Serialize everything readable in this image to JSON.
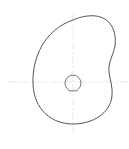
{
  "drawing": {
    "type": "cam-profile-sketch",
    "colors": {
      "background": "#ffffff",
      "profile": "#555555",
      "bore": "#666666",
      "centerline": "#d9d9d9"
    },
    "centerlines": {
      "horizontal": {
        "x1": 8,
        "y1": 82,
        "x2": 129,
        "y2": 82
      },
      "vertical": {
        "x1": 73,
        "y1": 14,
        "x2": 73,
        "y2": 136
      }
    },
    "profile_path": "M 73 124 C 52 124, 34 110, 33 84 C 32 58, 44 30, 73 20 C 80 17, 88 15, 96 16 C 110 18, 117 30, 115 46 C 113 56, 108 62, 109 72 C 110 80, 113 88, 112 96 C 110 114, 92 124, 73 124 Z",
    "bore": {
      "cx": 73,
      "cy": 82,
      "r": 8,
      "flat_y": 93,
      "path": "M 68.2 89.6 A 8 8 0 1 1 77.8 89.6 L 77 90.8 L 69 90.8 Z"
    }
  }
}
